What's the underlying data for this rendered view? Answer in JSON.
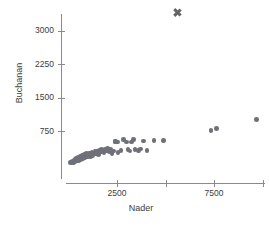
{
  "chart_data": {
    "type": "scatter",
    "title": "",
    "subtitle": "",
    "xlabel": "Nader",
    "ylabel": "Buchanan",
    "xlim": [
      0,
      10500
    ],
    "ylim": [
      0,
      3500
    ],
    "grid": false,
    "legend": null,
    "x_ticks": [
      {
        "value": 2500,
        "label": "2500"
      },
      {
        "value": 5000,
        "label": ""
      },
      {
        "value": 7500,
        "label": "7500"
      },
      {
        "value": 10000,
        "label": ""
      }
    ],
    "y_ticks": [
      {
        "value": 750,
        "label": "750"
      },
      {
        "value": 1500,
        "label": "1500"
      },
      {
        "value": 2250,
        "label": "2250"
      },
      {
        "value": 3000,
        "label": "3000"
      }
    ],
    "marker_color": "#70707a",
    "outlier_color": "#63636c",
    "axis_color": "#8a8a8e",
    "series": [
      {
        "name": "counties",
        "marker": "circle",
        "points": [
          [
            110,
            40
          ],
          [
            150,
            55
          ],
          [
            180,
            35
          ],
          [
            210,
            70
          ],
          [
            250,
            50
          ],
          [
            280,
            90
          ],
          [
            300,
            60
          ],
          [
            330,
            110
          ],
          [
            360,
            80
          ],
          [
            390,
            130
          ],
          [
            420,
            100
          ],
          [
            450,
            150
          ],
          [
            470,
            75
          ],
          [
            500,
            120
          ],
          [
            520,
            170
          ],
          [
            545,
            95
          ],
          [
            570,
            145
          ],
          [
            600,
            190
          ],
          [
            620,
            115
          ],
          [
            650,
            165
          ],
          [
            680,
            140
          ],
          [
            700,
            205
          ],
          [
            730,
            120
          ],
          [
            760,
            180
          ],
          [
            790,
            160
          ],
          [
            820,
            225
          ],
          [
            850,
            150
          ],
          [
            880,
            200
          ],
          [
            900,
            175
          ],
          [
            930,
            240
          ],
          [
            960,
            190
          ],
          [
            990,
            165
          ],
          [
            1020,
            230
          ],
          [
            1050,
            205
          ],
          [
            1080,
            255
          ],
          [
            1120,
            185
          ],
          [
            1150,
            245
          ],
          [
            1180,
            215
          ],
          [
            1210,
            270
          ],
          [
            1250,
            200
          ],
          [
            1290,
            260
          ],
          [
            1330,
            235
          ],
          [
            1370,
            285
          ],
          [
            1410,
            250
          ],
          [
            1450,
            300
          ],
          [
            1500,
            265
          ],
          [
            1550,
            230
          ],
          [
            1600,
            310
          ],
          [
            1650,
            280
          ],
          [
            1700,
            340
          ],
          [
            1760,
            295
          ],
          [
            1820,
            260
          ],
          [
            1880,
            330
          ],
          [
            1950,
            300
          ],
          [
            2020,
            355
          ],
          [
            2100,
            285
          ],
          [
            2180,
            330
          ],
          [
            2250,
            240
          ],
          [
            2320,
            300
          ],
          [
            2400,
            510
          ],
          [
            2430,
            520
          ],
          [
            2520,
            505
          ],
          [
            2560,
            270
          ],
          [
            2700,
            320
          ],
          [
            2850,
            555
          ],
          [
            2980,
            505
          ],
          [
            3060,
            340
          ],
          [
            3180,
            300
          ],
          [
            3260,
            500
          ],
          [
            3350,
            555
          ],
          [
            3420,
            330
          ],
          [
            3600,
            320
          ],
          [
            3720,
            350
          ],
          [
            3880,
            530
          ],
          [
            4050,
            310
          ],
          [
            4400,
            540
          ],
          [
            4900,
            540
          ],
          [
            7340,
            760
          ],
          [
            7620,
            800
          ],
          [
            9700,
            1010
          ]
        ]
      },
      {
        "name": "palm-beach-outlier",
        "marker": "x",
        "points": [
          [
            5620,
            3410
          ]
        ]
      }
    ]
  }
}
